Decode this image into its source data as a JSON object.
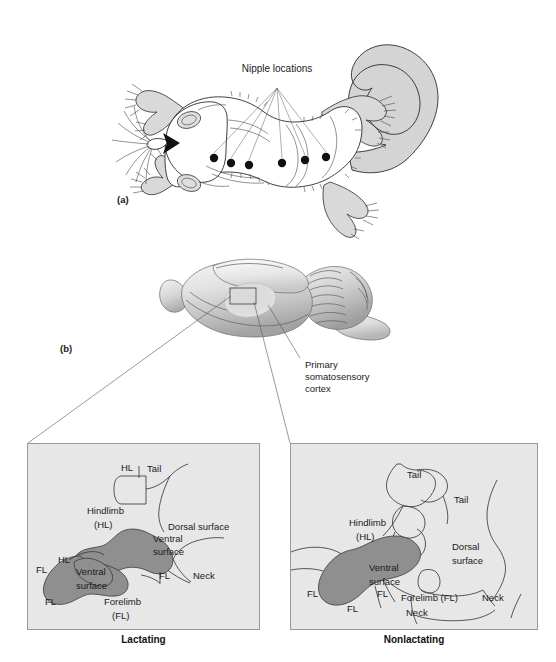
{
  "figure": {
    "parts": [
      {
        "id": "a",
        "label": "(a)"
      },
      {
        "id": "b",
        "label": "(b)"
      }
    ]
  },
  "panel_a": {
    "part_label": "(a)",
    "annotation": "Nipple locations",
    "nipple_count": 6,
    "nipple_points": [
      {
        "x": 214,
        "y": 158
      },
      {
        "x": 231,
        "y": 163
      },
      {
        "x": 249,
        "y": 165
      },
      {
        "x": 282,
        "y": 163
      },
      {
        "x": 305,
        "y": 160
      },
      {
        "x": 326,
        "y": 157
      }
    ],
    "fan_origin": {
      "x": 277,
      "y": 80
    },
    "subject": "rat-ventral-view"
  },
  "panel_b": {
    "part_label": "(b)",
    "annotation": "Primary\nsomatosensory\ncortex",
    "annotation_lines": [
      "Primary",
      "somatosensory",
      "cortex"
    ],
    "subject": "rat-brain-lateral-view"
  },
  "maps": {
    "lactating": {
      "caption": "Lactating",
      "labels": [
        {
          "text": "HL",
          "x": 120,
          "y": 470
        },
        {
          "text": "Tail",
          "x": 146,
          "y": 471
        },
        {
          "text": "Hindlimb",
          "x": 86,
          "y": 513
        },
        {
          "text": "(HL)",
          "x": 93,
          "y": 527
        },
        {
          "text": "Dorsal surface",
          "x": 167,
          "y": 529
        },
        {
          "text": "Ventral",
          "x": 152,
          "y": 541
        },
        {
          "text": "surface",
          "x": 152,
          "y": 554
        },
        {
          "text": "HL",
          "x": 57,
          "y": 562
        },
        {
          "text": "FL",
          "x": 35,
          "y": 572
        },
        {
          "text": "Ventral",
          "x": 75,
          "y": 574
        },
        {
          "text": "surface",
          "x": 75,
          "y": 588
        },
        {
          "text": "FL",
          "x": 158,
          "y": 578
        },
        {
          "text": "Neck",
          "x": 192,
          "y": 578
        },
        {
          "text": "FL",
          "x": 44,
          "y": 604
        },
        {
          "text": "Forelimb",
          "x": 103,
          "y": 604
        },
        {
          "text": "(FL)",
          "x": 111,
          "y": 618
        }
      ]
    },
    "nonlactating": {
      "caption": "Nonlactating",
      "labels": [
        {
          "text": "Tail",
          "x": 406,
          "y": 477
        },
        {
          "text": "Tail",
          "x": 453,
          "y": 502
        },
        {
          "text": "Hindlimb",
          "x": 348,
          "y": 525
        },
        {
          "text": "(HL)",
          "x": 355,
          "y": 539
        },
        {
          "text": "Dorsal",
          "x": 451,
          "y": 549
        },
        {
          "text": "surface",
          "x": 451,
          "y": 563
        },
        {
          "text": "Ventral",
          "x": 368,
          "y": 570
        },
        {
          "text": "surface",
          "x": 368,
          "y": 584
        },
        {
          "text": "FL",
          "x": 306,
          "y": 596
        },
        {
          "text": "FL",
          "x": 376,
          "y": 596
        },
        {
          "text": "Forelimb (FL)",
          "x": 400,
          "y": 600
        },
        {
          "text": "Neck",
          "x": 481,
          "y": 600
        },
        {
          "text": "FL",
          "x": 346,
          "y": 611
        },
        {
          "text": "Neck",
          "x": 405,
          "y": 615
        }
      ]
    }
  },
  "colors": {
    "ventral_region": "#8f8f8f",
    "panel_background": "#e7e7e7",
    "panel_border": "#9a9a9a",
    "ink": "#2b2b2b",
    "limb_fill": "#d9d9d9",
    "tail_fill": "#d4d4d4",
    "nipple_dot": "#111111",
    "page_background": "#ffffff"
  }
}
